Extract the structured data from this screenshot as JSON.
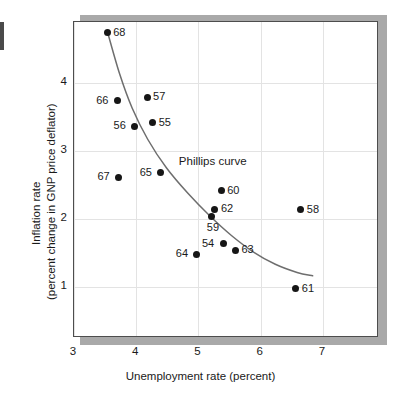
{
  "chart_data": {
    "type": "scatter",
    "title": "",
    "xlabel": "Unemployment rate (percent)",
    "ylabel_line1": "Inflation rate",
    "ylabel_line2": "(percent change in GNP price  deflator)",
    "xlim": [
      3,
      7.9
    ],
    "ylim": [
      0.25,
      4.9
    ],
    "xticks": [
      3,
      4,
      5,
      6,
      7
    ],
    "yticks": [
      1,
      2,
      3,
      4
    ],
    "xtick_labels": [
      "3",
      "4",
      "5",
      "6",
      "7"
    ],
    "ytick_labels": [
      "1",
      "2",
      "3",
      "4"
    ],
    "grid": true,
    "legend": "none",
    "annotations": [
      {
        "text": "Phillips curve",
        "x": 4.7,
        "y": 2.82
      }
    ],
    "point_labels": [
      "68",
      "66",
      "57",
      "56",
      "55",
      "67",
      "65",
      "60",
      "62",
      "59",
      "58",
      "54",
      "63",
      "64",
      "61"
    ],
    "points": [
      {
        "label": "68",
        "x": 3.55,
        "y": 4.73,
        "label_side": "right"
      },
      {
        "label": "66",
        "x": 3.71,
        "y": 3.73,
        "label_side": "left"
      },
      {
        "label": "57",
        "x": 4.19,
        "y": 3.78,
        "label_side": "right"
      },
      {
        "label": "56",
        "x": 3.99,
        "y": 3.35,
        "label_side": "left"
      },
      {
        "label": "55",
        "x": 4.28,
        "y": 3.4,
        "label_side": "right"
      },
      {
        "label": "67",
        "x": 3.73,
        "y": 2.6,
        "label_side": "left"
      },
      {
        "label": "65",
        "x": 4.41,
        "y": 2.67,
        "label_side": "left"
      },
      {
        "label": "60",
        "x": 5.38,
        "y": 2.4,
        "label_side": "right"
      },
      {
        "label": "62",
        "x": 5.28,
        "y": 2.13,
        "label_side": "right"
      },
      {
        "label": "59",
        "x": 5.23,
        "y": 2.03,
        "label_side": "below"
      },
      {
        "label": "58",
        "x": 6.66,
        "y": 2.12,
        "label_side": "right"
      },
      {
        "label": "54",
        "x": 5.41,
        "y": 1.62,
        "label_side": "left"
      },
      {
        "label": "63",
        "x": 5.61,
        "y": 1.53,
        "label_side": "right"
      },
      {
        "label": "64",
        "x": 4.99,
        "y": 1.47,
        "label_side": "left"
      },
      {
        "label": "61",
        "x": 6.58,
        "y": 0.96,
        "label_side": "right"
      }
    ],
    "curve": {
      "name": "Phillips curve",
      "color": "#6e6e6e",
      "points": [
        {
          "x": 3.56,
          "y": 4.72
        },
        {
          "x": 3.75,
          "y": 4.12
        },
        {
          "x": 3.95,
          "y": 3.62
        },
        {
          "x": 4.2,
          "y": 3.16
        },
        {
          "x": 4.5,
          "y": 2.74
        },
        {
          "x": 4.85,
          "y": 2.36
        },
        {
          "x": 5.2,
          "y": 2.03
        },
        {
          "x": 5.55,
          "y": 1.74
        },
        {
          "x": 5.9,
          "y": 1.5
        },
        {
          "x": 6.25,
          "y": 1.32
        },
        {
          "x": 6.6,
          "y": 1.2
        },
        {
          "x": 6.85,
          "y": 1.15
        }
      ]
    }
  },
  "colors": {
    "point": "#161616",
    "curve": "#6e6e6e",
    "grid": "#e3e3e3",
    "frame": "#4d4d4d",
    "shadow": "#a9a9a9",
    "text": "#1a1a1a",
    "background": "#ffffff"
  }
}
